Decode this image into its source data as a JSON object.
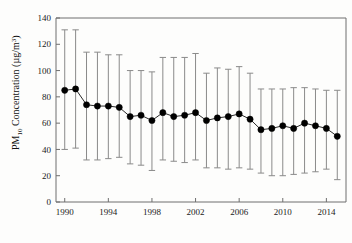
{
  "chart_data": {
    "type": "line",
    "title": "",
    "subtitle": "",
    "xlabel": "",
    "ylabel": "PM10 Concentration (µg/m³)",
    "ylabel_parts": {
      "prefix": "PM",
      "subscript": "10",
      "suffix": " Concentration (µg/m",
      "superscript": "3",
      "tail": ")"
    },
    "grid": false,
    "legend": "none",
    "xlim": [
      1989.2,
      2015.8
    ],
    "ylim": [
      0,
      140
    ],
    "ytick_labels": [
      "0",
      "20",
      "40",
      "60",
      "80",
      "100",
      "120",
      "140"
    ],
    "ytick_values": [
      0,
      20,
      40,
      60,
      80,
      100,
      120,
      140
    ],
    "xtick_labels": [
      "1990",
      "1994",
      "1998",
      "2002",
      "2006",
      "2010",
      "2014"
    ],
    "xtick_values": [
      1990,
      1994,
      1998,
      2002,
      2006,
      2010,
      2014
    ],
    "x": [
      1990,
      1991,
      1992,
      1993,
      1994,
      1995,
      1996,
      1997,
      1998,
      1999,
      2000,
      2001,
      2002,
      2003,
      2004,
      2005,
      2006,
      2007,
      2008,
      2009,
      2010,
      2011,
      2012,
      2013,
      2014,
      2015
    ],
    "values": [
      85,
      86,
      74,
      73,
      73,
      72,
      65,
      66,
      62,
      68,
      65,
      66,
      68,
      62,
      64,
      65,
      67,
      63,
      55,
      56,
      58,
      56,
      60,
      58,
      56,
      50
    ],
    "error_upper": [
      131,
      131,
      114,
      114,
      112,
      112,
      100,
      100,
      99,
      110,
      110,
      110,
      113,
      98,
      102,
      101,
      103,
      98,
      86,
      86,
      86,
      87,
      87,
      86,
      85,
      85
    ],
    "error_lower": [
      40,
      41,
      32,
      32,
      33,
      34,
      29,
      28,
      24,
      32,
      31,
      30,
      32,
      26,
      26,
      25,
      26,
      25,
      22,
      20,
      20,
      21,
      22,
      23,
      25,
      17
    ],
    "marker": "filled-circle",
    "series_name": "PM10 annual mean",
    "colors": {
      "marker": "#000000",
      "line": "#2a2a2a",
      "error_bar": "#8a8a8a",
      "frame": "#6f6f6f",
      "background": "#fdfdfc"
    }
  }
}
